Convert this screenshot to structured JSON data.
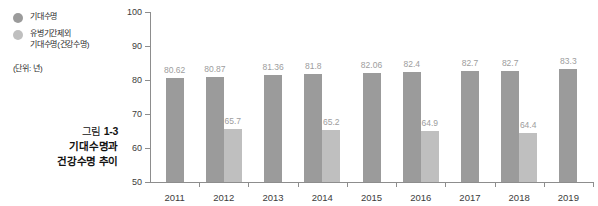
{
  "legend": {
    "items": [
      {
        "label": "기대수명",
        "color": "#9b9b9b",
        "marker": "circle-icon"
      },
      {
        "label": "유병기간제외\n기대수명(건강수명)",
        "color": "#bfbfbf",
        "marker": "circle-icon"
      }
    ]
  },
  "unit_note": "(단위: 년)",
  "caption": {
    "figure_label": "그림 ",
    "figure_number": "1-3",
    "line2": "기대수명과",
    "line3": "건강수명 추이"
  },
  "chart_data": {
    "type": "bar",
    "title": "",
    "xlabel": "",
    "ylabel": "",
    "unit": "년",
    "categories": [
      "2011",
      "2012",
      "2013",
      "2014",
      "2015",
      "2016",
      "2017",
      "2018",
      "2019"
    ],
    "ylim": [
      50,
      100
    ],
    "yticks": [
      50,
      60,
      70,
      80,
      90,
      100
    ],
    "ytick_labels": [
      "50",
      "60",
      "70",
      "80",
      "90",
      "100"
    ],
    "grid": false,
    "legend_position": "outside-left-top",
    "series": [
      {
        "name": "기대수명",
        "color": "#9b9b9b",
        "values": [
          80.62,
          80.87,
          81.36,
          81.8,
          82.06,
          82.4,
          82.7,
          82.7,
          83.3
        ],
        "labels": [
          "80.62",
          "80.87",
          "81.36",
          "81.8",
          "82.06",
          "82.4",
          "82.7",
          "82.7",
          "83.3"
        ]
      },
      {
        "name": "유병기간제외 기대수명(건강수명)",
        "color": "#bfbfbf",
        "values": [
          null,
          65.7,
          null,
          65.2,
          null,
          64.9,
          null,
          64.4,
          null
        ],
        "labels": [
          "",
          "65.7",
          "",
          "65.2",
          "",
          "64.9",
          "",
          "64.4",
          ""
        ]
      }
    ]
  }
}
